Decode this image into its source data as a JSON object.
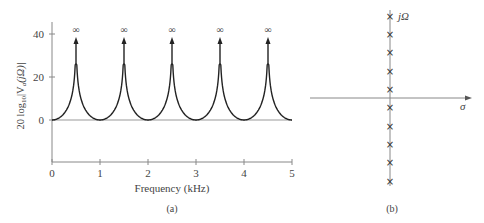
{
  "chart_data": [
    {
      "panel": "(a)",
      "type": "line",
      "title": "",
      "xlabel": "Frequency (kHz)",
      "ylabel": "20 log10|Va(jΩ)|",
      "xlim": [
        0,
        5
      ],
      "ylim": [
        -20,
        45
      ],
      "xticks": [
        "0",
        "1",
        "2",
        "3",
        "4",
        "5"
      ],
      "yticks": [
        "0",
        "20",
        "40"
      ],
      "grid": false,
      "annotations": [
        "∞",
        "∞",
        "∞",
        "∞",
        "∞"
      ],
      "peak_locations_khz": [
        0.5,
        1.5,
        2.5,
        3.5,
        4.5
      ],
      "zero_locations_khz": [
        0,
        1,
        2,
        3,
        4,
        5
      ],
      "series": [
        {
          "name": "magnitude",
          "x": [
            0,
            0.1,
            0.2,
            0.3,
            0.4,
            0.45,
            0.5,
            0.55,
            0.6,
            0.7,
            0.8,
            0.9,
            1.0
          ],
          "values": [
            0,
            0.4,
            1.7,
            4.6,
            10.2,
            16.1,
            "inf",
            16.1,
            10.2,
            4.6,
            1.7,
            0.4,
            0
          ],
          "note": "periodic with period 1 kHz; peaks go to infinity (arrows)"
        }
      ]
    },
    {
      "panel": "(b)",
      "type": "scatter",
      "title": "",
      "xlabel": "σ",
      "ylabel": "jΩ",
      "marker": "×",
      "note": "poles on the jΩ axis, equally spaced",
      "points": [
        {
          "sigma": 0,
          "omega_index": 5
        },
        {
          "sigma": 0,
          "omega_index": 4
        },
        {
          "sigma": 0,
          "omega_index": 3
        },
        {
          "sigma": 0,
          "omega_index": 2
        },
        {
          "sigma": 0,
          "omega_index": 1
        },
        {
          "sigma": 0,
          "omega_index": -1
        },
        {
          "sigma": 0,
          "omega_index": -2
        },
        {
          "sigma": 0,
          "omega_index": -3
        },
        {
          "sigma": 0,
          "omega_index": -4
        },
        {
          "sigma": 0,
          "omega_index": -5
        }
      ]
    }
  ],
  "labels": {
    "panel_a": "(a)",
    "panel_b": "(b)",
    "xlabel_a": "Frequency (kHz)",
    "ylabel_a_prefix": "20 log",
    "ylabel_a_sub": "10",
    "ylabel_a_mid": "|V",
    "ylabel_a_sub2": "a",
    "ylabel_a_suffix": "(jΩ)|",
    "xticks": [
      "0",
      "1",
      "2",
      "3",
      "4",
      "5"
    ],
    "yticks": [
      "40",
      "20",
      "0"
    ],
    "infinity": "∞",
    "sigma": "σ",
    "jomega": "jΩ"
  }
}
